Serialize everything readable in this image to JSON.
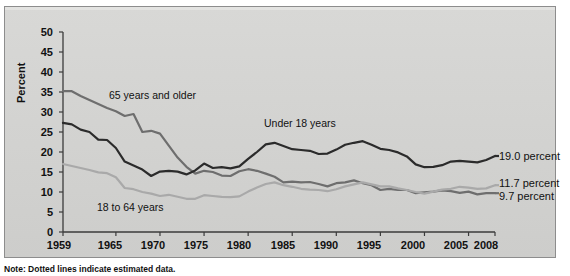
{
  "note": "Note: Dotted lines indicate estimated data.",
  "axis": {
    "ylabel": "Percent",
    "yticks": [
      "50",
      "45",
      "40",
      "35",
      "30",
      "25",
      "20",
      "15",
      "10",
      "5",
      "0"
    ],
    "xticks": [
      "1959",
      "1965",
      "1970",
      "1975",
      "1980",
      "1985",
      "1990",
      "1995",
      "2000",
      "2005",
      "2008"
    ]
  },
  "series_labels": {
    "older": "65 years and older",
    "under18": "Under 18 years",
    "adults": "18 to 64 years"
  },
  "end_labels": {
    "under18": "19.0 percent",
    "adults": "11.7 percent",
    "older": "9.7 percent"
  },
  "colors": {
    "under18": "#2b2b2b",
    "older": "#6e6e6e",
    "adults": "#a9a9a9",
    "panel_bg": "#d4d4d2",
    "frame": "#8d8d8d"
  },
  "chart_data": {
    "type": "line",
    "title": "",
    "xlabel": "",
    "ylabel": "Percent",
    "xlim": [
      1959,
      2008
    ],
    "ylim": [
      0,
      50
    ],
    "grid": false,
    "legend": "inline-annotations",
    "x": [
      1959,
      1960,
      1961,
      1962,
      1963,
      1964,
      1965,
      1966,
      1967,
      1968,
      1969,
      1970,
      1971,
      1972,
      1973,
      1974,
      1975,
      1976,
      1977,
      1978,
      1979,
      1980,
      1981,
      1982,
      1983,
      1984,
      1985,
      1986,
      1987,
      1988,
      1989,
      1990,
      1991,
      1992,
      1993,
      1994,
      1995,
      1996,
      1997,
      1998,
      1999,
      2000,
      2001,
      2002,
      2003,
      2004,
      2005,
      2006,
      2007,
      2008
    ],
    "series": [
      {
        "name": "65 years and older",
        "color": "#6e6e6e",
        "end_value": 9.7,
        "values": [
          35.2,
          35.2,
          34.0,
          33.0,
          32.0,
          31.0,
          30.2,
          29.0,
          29.5,
          25.0,
          25.3,
          24.6,
          21.6,
          18.6,
          16.3,
          14.6,
          15.3,
          15.0,
          14.1,
          14.0,
          15.2,
          15.7,
          15.3,
          14.6,
          13.8,
          12.4,
          12.6,
          12.4,
          12.5,
          12.0,
          11.4,
          12.2,
          12.4,
          12.9,
          12.2,
          11.7,
          10.5,
          10.8,
          10.5,
          10.5,
          9.7,
          9.9,
          10.1,
          10.4,
          10.2,
          9.8,
          10.1,
          9.4,
          9.7,
          9.7
        ]
      },
      {
        "name": "Under 18 years",
        "color": "#2b2b2b",
        "end_value": 19.0,
        "values": [
          27.3,
          26.9,
          25.6,
          25.0,
          23.1,
          23.0,
          21.0,
          17.6,
          16.6,
          15.6,
          14.0,
          15.1,
          15.3,
          15.1,
          14.4,
          15.4,
          17.1,
          16.0,
          16.2,
          15.9,
          16.4,
          18.3,
          20.0,
          21.9,
          22.3,
          21.5,
          20.7,
          20.5,
          20.3,
          19.5,
          19.6,
          20.6,
          21.8,
          22.3,
          22.7,
          21.8,
          20.8,
          20.5,
          19.9,
          18.9,
          16.9,
          16.2,
          16.3,
          16.7,
          17.6,
          17.8,
          17.6,
          17.4,
          18.0,
          19.0
        ]
      },
      {
        "name": "18 to 64 years",
        "color": "#a9a9a9",
        "end_value": 11.7,
        "values": [
          17.0,
          16.5,
          16.0,
          15.5,
          14.9,
          14.7,
          13.7,
          11.0,
          10.7,
          10.0,
          9.6,
          9.0,
          9.3,
          8.8,
          8.3,
          8.3,
          9.2,
          9.0,
          8.8,
          8.7,
          8.9,
          10.1,
          11.1,
          12.0,
          12.4,
          11.7,
          11.3,
          10.8,
          10.6,
          10.5,
          10.2,
          10.7,
          11.4,
          11.9,
          12.4,
          11.9,
          11.4,
          11.4,
          10.9,
          10.5,
          10.0,
          9.6,
          10.1,
          10.6,
          10.8,
          11.3,
          11.1,
          10.8,
          10.9,
          11.7
        ]
      }
    ]
  }
}
